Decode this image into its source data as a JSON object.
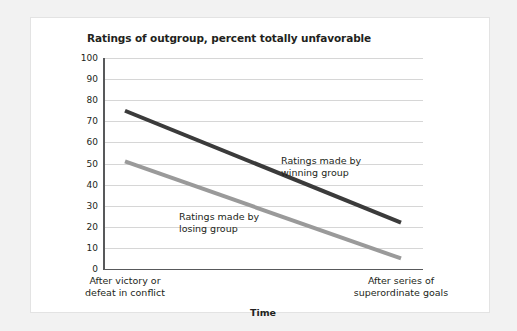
{
  "chart_data": {
    "type": "line",
    "title": "Ratings of outgroup, percent totally unfavorable",
    "xlabel": "Time",
    "ylabel": "",
    "ylim": [
      0,
      100
    ],
    "yticks": [
      0,
      10,
      20,
      30,
      40,
      50,
      60,
      70,
      80,
      90,
      100
    ],
    "grid": true,
    "legend": "in-plot annotations",
    "categories": [
      "After victory or\ndefeat in conflict",
      "After series of\nsuperordinate goals"
    ],
    "category_lines": [
      [
        "After victory or",
        "defeat in conflict"
      ],
      [
        "After series of",
        "superordinate goals"
      ]
    ],
    "series": [
      {
        "name": "Ratings made by winning group",
        "values": [
          75,
          22
        ],
        "color": "#3b3b3b",
        "annotation_lines": [
          "Ratings made by",
          "winning group"
        ]
      },
      {
        "name": "Ratings made by losing group",
        "values": [
          51,
          5
        ],
        "color": "#9a9a9a",
        "annotation_lines": [
          "Ratings made by",
          "losing group"
        ]
      }
    ]
  },
  "figure": {
    "panel_background": "#ffffff",
    "page_background": "#f2f2f2",
    "axis_color": "#58595b",
    "gridline_color": "#d6d6d6"
  }
}
